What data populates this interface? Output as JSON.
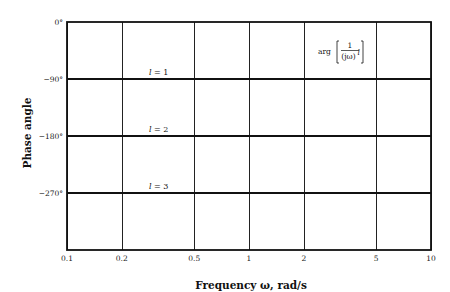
{
  "chart_data": {
    "type": "line",
    "title": "",
    "xlabel": "Frequency ω, rad/s",
    "ylabel": "Phase angle",
    "xscale": "log",
    "xlim": [
      0.1,
      10
    ],
    "ylim": [
      -360,
      0
    ],
    "grid": true,
    "legend": "none",
    "x_ticks": [
      {
        "value": 0.1,
        "label": "0.1"
      },
      {
        "value": 0.2,
        "label": "0.2"
      },
      {
        "value": 0.5,
        "label": "0.5"
      },
      {
        "value": 1,
        "label": "1"
      },
      {
        "value": 2,
        "label": "2"
      },
      {
        "value": 5,
        "label": "5"
      },
      {
        "value": 10,
        "label": "10"
      }
    ],
    "y_ticks": [
      {
        "value": 0,
        "label": "0°"
      },
      {
        "value": -90,
        "label": "−90°"
      },
      {
        "value": -180,
        "label": "−180°"
      },
      {
        "value": -270,
        "label": "−270°"
      }
    ],
    "x": [
      0.1,
      10
    ],
    "series": [
      {
        "name": "l = 1",
        "l": "1",
        "values": [
          -90,
          -90
        ]
      },
      {
        "name": "l = 2",
        "l": "2",
        "values": [
          -180,
          -180
        ]
      },
      {
        "name": "l = 3",
        "l": "3",
        "values": [
          -270,
          -270
        ]
      }
    ],
    "annotation": {
      "prefix": "arg",
      "numerator": "1",
      "denominator_base": "(jω)",
      "denominator_exponent": "l",
      "text": "arg [1/(jω)^l]"
    }
  },
  "colors": {
    "line": "#111111",
    "grid": "#222222",
    "background": "#ffffff"
  }
}
